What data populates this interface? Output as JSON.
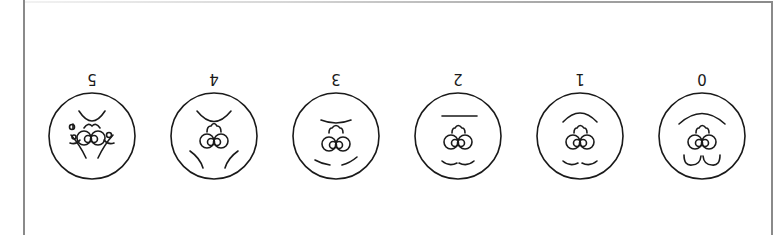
{
  "figure": {
    "orientation": "rotated 180 degrees",
    "stroke_color": "#1a1a1a",
    "frame_color": "#8a8a8a",
    "stages": [
      {
        "label": "5",
        "cx": 92
      },
      {
        "label": "4",
        "cx": 214
      },
      {
        "label": "3",
        "cx": 336
      },
      {
        "label": "2",
        "cx": 458
      },
      {
        "label": "1",
        "cx": 580
      },
      {
        "label": "0",
        "cx": 702
      }
    ]
  }
}
